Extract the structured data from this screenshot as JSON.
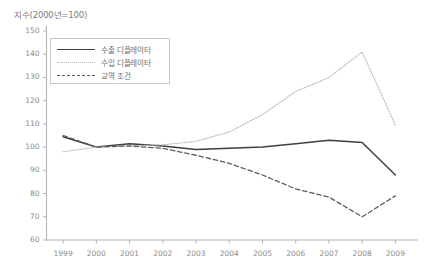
{
  "chart_data": {
    "type": "line",
    "title": "지수(2000년=100)",
    "xlabel": "",
    "ylabel": "지수(2000년=100)",
    "x": [
      1999,
      2000,
      2001,
      2002,
      2003,
      2004,
      2005,
      2006,
      2007,
      2008,
      2009
    ],
    "categories": [
      "1999",
      "2000",
      "2001",
      "2002",
      "2003",
      "2004",
      "2005",
      "2006",
      "2007",
      "2008",
      "2009"
    ],
    "ylim": [
      60,
      150
    ],
    "yticks": [
      60,
      70,
      80,
      90,
      100,
      110,
      120,
      130,
      140,
      150
    ],
    "ytick_labels": [
      "60",
      "70",
      "80",
      "90",
      "100",
      "110",
      "120",
      "130",
      "140",
      "150"
    ],
    "grid": false,
    "legend_position": "upper-left",
    "series": [
      {
        "name": "수출 디플레이터",
        "style": "solid",
        "color": "#3f3f3f",
        "values": [
          104.5,
          100.0,
          101.5,
          100.5,
          99.0,
          99.5,
          100.0,
          101.5,
          103.0,
          102.0,
          88.0
        ]
      },
      {
        "name": "수입 디플레이터",
        "style": "dotted",
        "color": "#bdbdbd",
        "values": [
          98.0,
          100.0,
          100.5,
          101.0,
          102.5,
          106.5,
          114.0,
          124.0,
          130.0,
          141.0,
          109.5
        ]
      },
      {
        "name": "교역 조건",
        "style": "dashed",
        "color": "#5e5e5e",
        "values": [
          105.0,
          100.0,
          100.5,
          99.5,
          96.5,
          93.0,
          88.0,
          82.0,
          78.5,
          70.0,
          79.0
        ]
      }
    ]
  },
  "legend": {
    "items": [
      {
        "label": "수출 디플레이터"
      },
      {
        "label": "수입 디플레이터"
      },
      {
        "label": "교역 조건"
      }
    ]
  }
}
